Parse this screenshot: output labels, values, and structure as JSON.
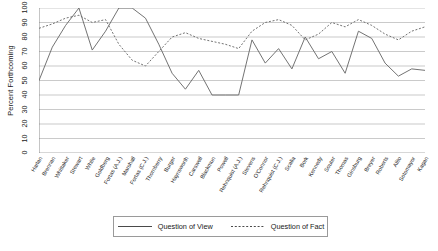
{
  "chart_data": {
    "type": "line",
    "title": "",
    "xlabel": "",
    "ylabel": "Percent Forthcoming",
    "ylim": [
      0,
      100
    ],
    "yticks": [
      0,
      10,
      20,
      30,
      40,
      50,
      60,
      70,
      80,
      90,
      100
    ],
    "grid": true,
    "legend_position": "bottom",
    "categories": [
      "Harlan",
      "Brennan",
      "Whittaker",
      "Stewart",
      "White",
      "Goldberg",
      "Fortas (A.J.)",
      "Marshall",
      "Fortas (C.J.)",
      "Thornberry",
      "Burger",
      "Haynsworth",
      "Carswell",
      "Blackmun",
      "Powell",
      "Rehnquist (A.J.)",
      "Stevens",
      "O'Connor",
      "Rehnquist (C.J.)",
      "Scalia",
      "Bork",
      "Kennedy",
      "Souter",
      "Thomas",
      "Ginsburg",
      "Breyer",
      "Roberts",
      "Alito",
      "Sotomayor",
      "Kagan"
    ],
    "series": [
      {
        "name": "Question of View",
        "style": "solid",
        "color": "#6b6b6b",
        "values": [
          50,
          73,
          88,
          100,
          71,
          84,
          100,
          100,
          93,
          75,
          55,
          44,
          57,
          40,
          40,
          40,
          78,
          62,
          72,
          58,
          80,
          65,
          70,
          55,
          84,
          79,
          62,
          53,
          58,
          57
        ]
      },
      {
        "name": "Question of Fact",
        "style": "dotted",
        "color": "#6b6b6b",
        "values": [
          86,
          89,
          93,
          95,
          90,
          92,
          75,
          64,
          60,
          70,
          80,
          83,
          79,
          77,
          75,
          72,
          84,
          90,
          92,
          88,
          78,
          82,
          90,
          87,
          92,
          88,
          82,
          78,
          84,
          87
        ]
      }
    ]
  },
  "legend": {
    "items": [
      {
        "label": "Question of View"
      },
      {
        "label": "Question of Fact"
      }
    ]
  }
}
